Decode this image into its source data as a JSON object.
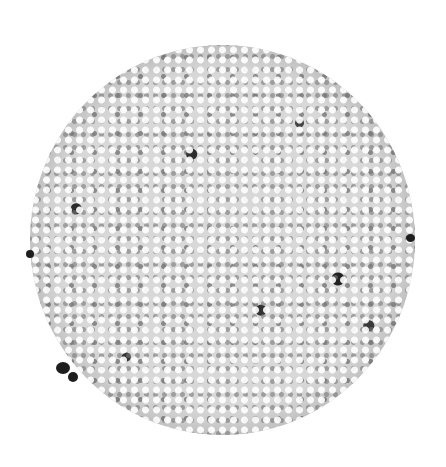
{
  "image": {
    "subject": "hulled hemp seeds pile",
    "background_color": "#ffffff",
    "pile_colors": {
      "light": "#e6e6e6",
      "mid": "#9a9a9a",
      "dark": "#1e1e1e"
    }
  }
}
